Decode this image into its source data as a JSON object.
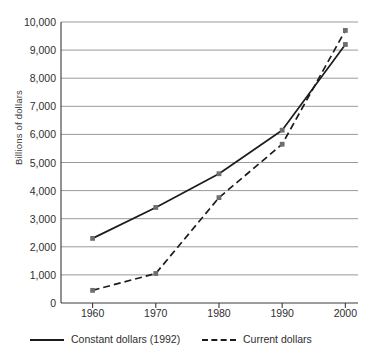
{
  "chart_data": {
    "type": "line",
    "title": "",
    "subtitle": "",
    "xlabel": "",
    "ylabel": "Billions of dollars",
    "x": [
      1960,
      1970,
      1980,
      1990,
      2000
    ],
    "xticklabels": [
      "1960",
      "1970",
      "1980",
      "1990",
      "2000"
    ],
    "xlim": [
      1955,
      2002
    ],
    "ylim": [
      0,
      10000
    ],
    "yticks": [
      0,
      1000,
      2000,
      3000,
      4000,
      5000,
      6000,
      7000,
      8000,
      9000,
      10000
    ],
    "yticklabels": [
      "0",
      "1,000",
      "2,000",
      "3,000",
      "4,000",
      "5,000",
      "6,000",
      "7,000",
      "8,000",
      "9,000",
      "10,000"
    ],
    "grid": "horizontal",
    "legend_position": "below",
    "series": [
      {
        "name": "Constant dollars (1992)",
        "style": "solid",
        "color": "#1c1c1c",
        "marker": "square",
        "marker_color": "#6e6e6e",
        "values": [
          2300,
          3400,
          4600,
          6150,
          9200
        ]
      },
      {
        "name": "Current dollars",
        "style": "dashed",
        "color": "#1c1c1c",
        "marker": "square",
        "marker_color": "#6e6e6e",
        "values": [
          450,
          1050,
          3750,
          5650,
          9700
        ]
      }
    ]
  },
  "legend": {
    "items": [
      {
        "label": "Constant dollars (1992)",
        "style": "solid"
      },
      {
        "label": "Current dollars",
        "style": "dashed"
      }
    ]
  },
  "colors": {
    "line": "#1c1c1c",
    "marker": "#6e6e6e",
    "gridline": "#9a9a9a",
    "axis": "#3a3a3a",
    "text": "#2e2e2e",
    "background": "#ffffff"
  }
}
